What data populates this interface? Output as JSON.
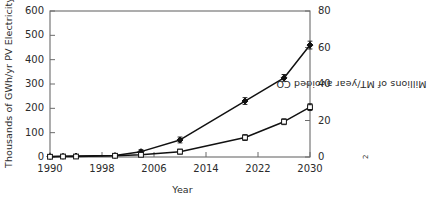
{
  "chart_data": {
    "type": "line",
    "title": "",
    "xlabel": "Year",
    "ylabel": "Thousands of GWh/yr PV Electricity",
    "ylabel_right": "Millions of MT/year avoided CO2",
    "ylabel_right_prefix": "Millions of MT/year avoided CO",
    "ylabel_right_subscript": "2",
    "grid": false,
    "legend": "none",
    "xlim": [
      1990,
      2030
    ],
    "ylim": [
      0,
      600
    ],
    "ylim_right": [
      0,
      80
    ],
    "xticks": [
      "1990",
      "1998",
      "2006",
      "2014",
      "2022",
      "2030"
    ],
    "xtick_values": [
      1990,
      1998,
      2006,
      2014,
      2022,
      2030
    ],
    "yticks_left": [
      "0",
      "100",
      "200",
      "300",
      "400",
      "500",
      "600"
    ],
    "ytick_values_left": [
      0,
      100,
      200,
      300,
      400,
      500,
      600
    ],
    "yticks_right": [
      "0",
      "20",
      "40",
      "60",
      "80"
    ],
    "ytick_values_right": [
      0,
      20,
      40,
      60,
      80
    ],
    "x": [
      1990,
      1992,
      1994,
      2000,
      2004,
      2010,
      2020,
      2026,
      2030
    ],
    "series": [
      {
        "name": "High scenario",
        "marker": "filled-diamond",
        "color": "#111111",
        "values": [
          2,
          3,
          4,
          6,
          22,
          70,
          230,
          325,
          460
        ],
        "errors": [
          2,
          3,
          3,
          4,
          8,
          12,
          14,
          14,
          16
        ]
      },
      {
        "name": "Low scenario",
        "marker": "open-square",
        "color": "#111111",
        "values": [
          1,
          2,
          2,
          5,
          9,
          22,
          80,
          145,
          205
        ],
        "errors": [
          2,
          2,
          2,
          4,
          7,
          10,
          12,
          12,
          14
        ]
      }
    ]
  }
}
